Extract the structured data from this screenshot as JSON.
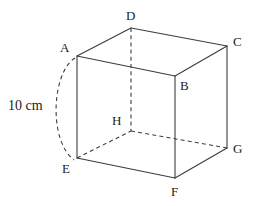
{
  "figure": {
    "type": "geometry-diagram",
    "width": 257,
    "height": 206,
    "background_color": "#ffffff",
    "stroke_color": "#3c3c3c",
    "text_color": "#1c1c1c"
  },
  "measurement": {
    "label": "10 cm",
    "value": 10,
    "unit": "cm",
    "measures_edge": "A-E",
    "label_x": 8,
    "label_y": 99,
    "arc": {
      "from": "A",
      "to": "E",
      "style": "dashed",
      "path": "M 75 58 C 52 72, 48 140, 74 160"
    }
  },
  "vertices": [
    {
      "id": "A",
      "label": "A",
      "x": 77,
      "y": 56,
      "label_x": 60,
      "label_y": 41,
      "hidden": false
    },
    {
      "id": "B",
      "label": "B",
      "x": 175,
      "y": 76,
      "label_x": 180,
      "label_y": 79,
      "hidden": false
    },
    {
      "id": "C",
      "label": "C",
      "x": 227,
      "y": 46,
      "label_x": 233,
      "label_y": 35,
      "hidden": false
    },
    {
      "id": "D",
      "label": "D",
      "x": 131,
      "y": 28,
      "label_x": 126,
      "label_y": 9,
      "hidden": false
    },
    {
      "id": "E",
      "label": "E",
      "x": 77,
      "y": 158,
      "label_x": 62,
      "label_y": 162,
      "hidden": false
    },
    {
      "id": "F",
      "label": "F",
      "x": 175,
      "y": 178,
      "label_x": 171,
      "label_y": 185,
      "hidden": false
    },
    {
      "id": "G",
      "label": "G",
      "x": 227,
      "y": 148,
      "label_x": 233,
      "label_y": 142,
      "hidden": false
    },
    {
      "id": "H",
      "label": "H",
      "x": 131,
      "y": 131,
      "label_x": 112,
      "label_y": 114,
      "hidden": true
    }
  ],
  "edges": [
    {
      "from": "A",
      "to": "D",
      "style": "solid",
      "x1": 77,
      "y1": 56,
      "x2": 131,
      "y2": 28
    },
    {
      "from": "D",
      "to": "C",
      "style": "solid",
      "x1": 131,
      "y1": 28,
      "x2": 227,
      "y2": 46
    },
    {
      "from": "A",
      "to": "B",
      "style": "solid",
      "x1": 77,
      "y1": 56,
      "x2": 175,
      "y2": 76
    },
    {
      "from": "B",
      "to": "C",
      "style": "solid",
      "x1": 175,
      "y1": 76,
      "x2": 227,
      "y2": 46
    },
    {
      "from": "A",
      "to": "E",
      "style": "solid",
      "x1": 77,
      "y1": 56,
      "x2": 77,
      "y2": 158
    },
    {
      "from": "B",
      "to": "F",
      "style": "solid",
      "x1": 175,
      "y1": 76,
      "x2": 175,
      "y2": 178
    },
    {
      "from": "C",
      "to": "G",
      "style": "solid",
      "x1": 227,
      "y1": 46,
      "x2": 227,
      "y2": 148
    },
    {
      "from": "E",
      "to": "F",
      "style": "solid",
      "x1": 77,
      "y1": 158,
      "x2": 175,
      "y2": 178
    },
    {
      "from": "F",
      "to": "G",
      "style": "solid",
      "x1": 175,
      "y1": 178,
      "x2": 227,
      "y2": 148
    },
    {
      "from": "D",
      "to": "H",
      "style": "dashed",
      "x1": 131,
      "y1": 28,
      "x2": 131,
      "y2": 131
    },
    {
      "from": "E",
      "to": "H",
      "style": "dashed",
      "x1": 77,
      "y1": 158,
      "x2": 131,
      "y2": 131
    },
    {
      "from": "H",
      "to": "G",
      "style": "dashed",
      "x1": 131,
      "y1": 131,
      "x2": 227,
      "y2": 148
    }
  ]
}
